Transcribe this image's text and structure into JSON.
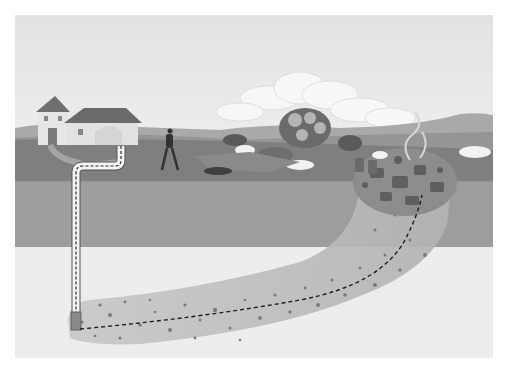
{
  "illustration": {
    "subject": "groundwater contamination cross-section",
    "elements": [
      "sky",
      "clouds",
      "hills",
      "house",
      "walking-person",
      "trees",
      "waste-pit",
      "barrels",
      "smoke",
      "soil-layers",
      "contamination-plume",
      "well-pipe",
      "flow-path"
    ],
    "colors": {
      "sky_top": "#e2e2e2",
      "sky_bottom": "#ececec",
      "hills": "#9c9c9c",
      "grass": "#7d7d7d",
      "topsoil": "#9a9a9a",
      "subsoil": "#ededed",
      "plume": "#b9b9b9",
      "plume_dots": "#7a7a7a",
      "house_wall": "#e6e6e6",
      "roof": "#6f6f6f",
      "pipe": "#f4f4f4",
      "dash": "#2a2a2a"
    }
  }
}
